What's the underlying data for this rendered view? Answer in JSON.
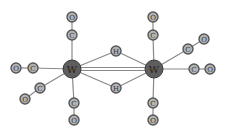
{
  "colors": {
    "bond": "#8a8a8a",
    "W_fill": "#5e5e5e",
    "W_stroke": "#3a3a3a",
    "small_fill": "#b5b5b5",
    "small_stroke": "#555555",
    "label": "#333333"
  },
  "atoms": [
    {
      "id": "W1",
      "label": "W",
      "x": 72,
      "y": 69,
      "r": 9
    },
    {
      "id": "W2",
      "label": "W",
      "x": 154,
      "y": 69,
      "r": 9
    },
    {
      "id": "H1",
      "label": "H",
      "x": 116,
      "y": 51,
      "r": 5
    },
    {
      "id": "H2",
      "label": "H",
      "x": 116,
      "y": 88,
      "r": 5
    },
    {
      "id": "C1",
      "label": "C",
      "x": 72,
      "y": 35,
      "r": 5
    },
    {
      "id": "O1",
      "label": "O",
      "x": 72,
      "y": 17,
      "r": 5
    },
    {
      "id": "C2",
      "label": "C",
      "x": 33,
      "y": 68,
      "r": 5
    },
    {
      "id": "O2",
      "label": "O",
      "x": 16,
      "y": 68,
      "r": 5
    },
    {
      "id": "C3",
      "label": "C",
      "x": 40,
      "y": 88,
      "r": 5
    },
    {
      "id": "O3",
      "label": "O",
      "x": 25,
      "y": 99,
      "r": 5
    },
    {
      "id": "C4",
      "label": "C",
      "x": 74,
      "y": 103,
      "r": 5
    },
    {
      "id": "O4",
      "label": "O",
      "x": 74,
      "y": 120,
      "r": 5
    },
    {
      "id": "C5",
      "label": "C",
      "x": 153,
      "y": 35,
      "r": 5
    },
    {
      "id": "O5",
      "label": "O",
      "x": 153,
      "y": 17,
      "r": 5
    },
    {
      "id": "C6",
      "label": "C",
      "x": 188,
      "y": 49,
      "r": 5
    },
    {
      "id": "O6",
      "label": "O",
      "x": 204,
      "y": 39,
      "r": 5
    },
    {
      "id": "C7",
      "label": "C",
      "x": 194,
      "y": 69,
      "r": 5
    },
    {
      "id": "O7",
      "label": "O",
      "x": 210,
      "y": 69,
      "r": 5
    },
    {
      "id": "C8",
      "label": "C",
      "x": 153,
      "y": 103,
      "r": 5
    },
    {
      "id": "O8",
      "label": "O",
      "x": 153,
      "y": 120,
      "r": 5
    }
  ],
  "bonds": [
    {
      "a": "W1",
      "b": "W2",
      "double": true
    },
    {
      "a": "W1",
      "b": "H1"
    },
    {
      "a": "H1",
      "b": "W2"
    },
    {
      "a": "W1",
      "b": "H2"
    },
    {
      "a": "H2",
      "b": "W2"
    },
    {
      "a": "W1",
      "b": "C1"
    },
    {
      "a": "C1",
      "b": "O1"
    },
    {
      "a": "W1",
      "b": "C2"
    },
    {
      "a": "C2",
      "b": "O2"
    },
    {
      "a": "W1",
      "b": "C3"
    },
    {
      "a": "C3",
      "b": "O3"
    },
    {
      "a": "W1",
      "b": "C4"
    },
    {
      "a": "C4",
      "b": "O4"
    },
    {
      "a": "W2",
      "b": "C5"
    },
    {
      "a": "C5",
      "b": "O5"
    },
    {
      "a": "W2",
      "b": "C6"
    },
    {
      "a": "C6",
      "b": "O6"
    },
    {
      "a": "W2",
      "b": "C7"
    },
    {
      "a": "C7",
      "b": "O7"
    },
    {
      "a": "W2",
      "b": "C8"
    },
    {
      "a": "C8",
      "b": "O8"
    }
  ]
}
